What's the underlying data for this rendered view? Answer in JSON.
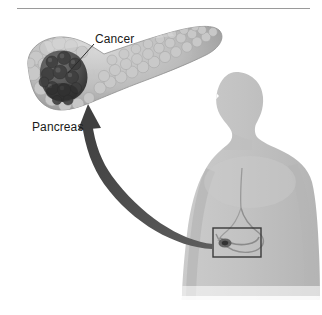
{
  "figure": {
    "background_color": "#ffffff",
    "width": 322,
    "height": 315
  },
  "rule": {
    "name": "top-divider-rule",
    "x1": 17,
    "x2": 310,
    "y": 8,
    "color": "#9a9a9a",
    "thickness": 1
  },
  "labels": {
    "cancer": "Cancer",
    "pancreas": "Pancreas",
    "text_color": "#1a1a1a",
    "font_size_px": 12
  },
  "leader_line": {
    "name": "cancer-leader-line",
    "from_x": 94,
    "from_y": 44,
    "to_x": 68,
    "to_y": 73,
    "color": "#2b2b2b",
    "thickness": 1
  },
  "pancreas_organ": {
    "name": "pancreas-illustration",
    "body_color": "#b9b9b9",
    "shade_color": "#8d8d8d",
    "highlight_color": "#d2d2d2",
    "outline_color": "#8a8a8a",
    "head_center": [
      60,
      78
    ],
    "tail_tip": [
      222,
      28
    ],
    "lobule_count": 84
  },
  "tumor": {
    "name": "cancer-tumor-mass",
    "color": "#4a4a4a",
    "dark_color": "#2e2e2e",
    "center": [
      68,
      76
    ],
    "nodule_count": 22
  },
  "arrow": {
    "name": "zoom-callout-arrow",
    "color": "#4d4d4d",
    "tip_x": 88,
    "tip_y": 105,
    "tail_x": 215,
    "tail_y": 244,
    "max_width_px": 9
  },
  "body_figure": {
    "name": "human-torso-silhouette",
    "fill_color": "#c4c4c4",
    "shade_color": "#b0b0b0",
    "orientation": "facing-left",
    "head_top_y": 72
  },
  "inset_box": {
    "name": "abdomen-highlight-box",
    "x": 213,
    "y": 228,
    "width": 48,
    "height": 29,
    "stroke_color": "#3a3a3a",
    "stroke_width": 1.4
  },
  "internal_organs": {
    "name": "stomach-and-pancreas-outline",
    "stroke_color": "#8f8f8f",
    "small_tumor_color": "#4a4a4a"
  }
}
